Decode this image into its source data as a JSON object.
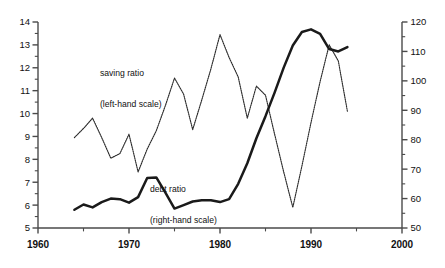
{
  "chart_data": {
    "type": "line",
    "title": "",
    "xlabel": "",
    "ylabel": "",
    "xlim": [
      1960,
      2000
    ],
    "ylim_left": [
      5,
      14
    ],
    "ylim_right": [
      50,
      120
    ],
    "grid": false,
    "legend_position": "inline-annotation",
    "x_ticks_major": [
      1960,
      1970,
      1980,
      1990,
      2000
    ],
    "x_ticks_minor": [
      1965,
      1975,
      1985,
      1995
    ],
    "x_tick_labels": [
      "1960",
      "1970",
      "1980",
      "1990",
      "2000"
    ],
    "y_left_ticks_major": [
      5,
      6,
      7,
      8,
      9,
      10,
      11,
      12,
      13,
      14
    ],
    "y_left_tick_labels": [
      "5",
      "6",
      "7",
      "8",
      "9",
      "10",
      "11",
      "12",
      "13",
      "14"
    ],
    "y_left_ticks_minor": [
      5.5,
      6.5,
      7.5,
      8.5,
      9.5,
      10.5,
      11.5,
      12.5,
      13.5
    ],
    "y_right_ticks_major": [
      50,
      60,
      70,
      80,
      90,
      100,
      110,
      120
    ],
    "y_right_tick_labels": [
      "50",
      "60",
      "70",
      "80",
      "90",
      "100",
      "110",
      "120"
    ],
    "y_right_ticks_minor": [
      55,
      65,
      75,
      85,
      95,
      105,
      115
    ],
    "series": [
      {
        "name": "saving ratio",
        "axis": "left",
        "style": "dotted-thin",
        "color": "#2b2b2b",
        "label_text": "saving ratio\n(left-hand scale)",
        "x": [
          1964,
          1965,
          1966,
          1967,
          1968,
          1969,
          1970,
          1971,
          1972,
          1973,
          1974,
          1975,
          1976,
          1977,
          1978,
          1979,
          1980,
          1981,
          1982,
          1983,
          1984,
          1985,
          1986,
          1987,
          1988,
          1989,
          1990,
          1991,
          1992,
          1993,
          1994
        ],
        "values": [
          8.95,
          9.35,
          9.8,
          8.95,
          8.05,
          8.25,
          9.1,
          7.45,
          8.45,
          9.25,
          10.35,
          11.55,
          10.85,
          9.3,
          10.6,
          11.95,
          13.45,
          12.45,
          11.6,
          9.8,
          11.2,
          10.8,
          9.1,
          7.45,
          5.9,
          7.7,
          9.6,
          11.4,
          13.0,
          12.3,
          10.1
        ]
      },
      {
        "name": "debt ratio",
        "axis": "right",
        "style": "solid-thick",
        "color": "#1a1a1a",
        "label_text": "debt ratio\n(right-hand scale)",
        "x": [
          1964,
          1965,
          1966,
          1967,
          1968,
          1969,
          1970,
          1971,
          1972,
          1973,
          1974,
          1975,
          1976,
          1977,
          1978,
          1979,
          1980,
          1981,
          1982,
          1983,
          1984,
          1985,
          1986,
          1987,
          1988,
          1989,
          1990,
          1991,
          1992,
          1993,
          1994
        ],
        "values": [
          56.2,
          58.0,
          57.0,
          58.8,
          60.0,
          59.8,
          58.6,
          60.5,
          67.0,
          67.2,
          62.0,
          56.6,
          57.8,
          59.0,
          59.4,
          59.4,
          58.8,
          59.8,
          65.0,
          72.0,
          80.5,
          88.0,
          96.0,
          104.5,
          112.0,
          116.6,
          117.5,
          116.0,
          110.8,
          110.0,
          111.5
        ]
      }
    ]
  },
  "annotations": {
    "saving_label_line1": "saving ratio",
    "saving_label_line2": "(left-hand scale)",
    "debt_label_line1": "debt ratio",
    "debt_label_line2": "(right-hand scale)"
  },
  "colors": {
    "axis": "#4a4a4a",
    "text": "#111111",
    "saving_series": "#2b2b2b",
    "debt_series": "#1a1a1a",
    "background": "#ffffff"
  }
}
